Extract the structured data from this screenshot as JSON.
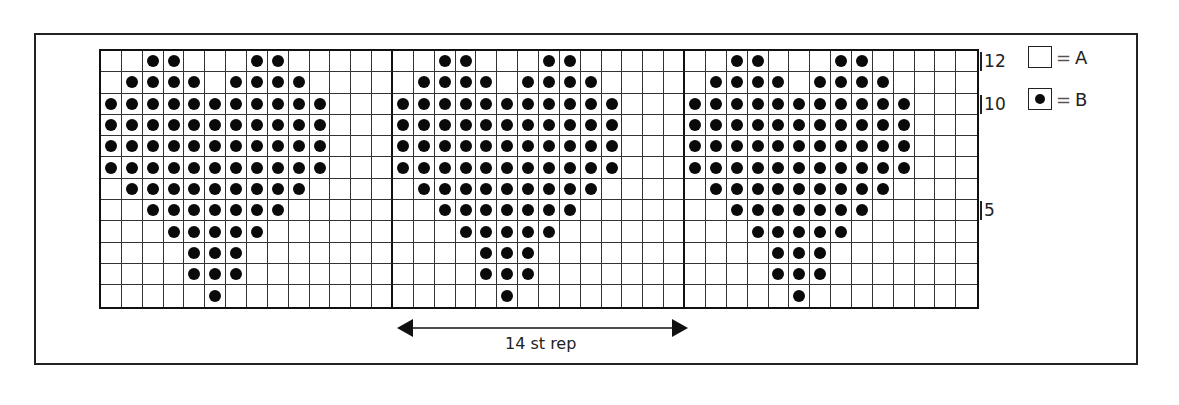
{
  "chart": {
    "stitch_repeat": 14,
    "repeats_shown": 3,
    "rows": 12,
    "repeat_label": "14 st rep",
    "row_labels": [
      {
        "row": 12,
        "text": "12"
      },
      {
        "row": 10,
        "text": "10"
      },
      {
        "row": 5,
        "text": "5"
      }
    ],
    "pattern_rows_top_to_bottom": [
      {
        "row": 12,
        "dots": [
          2,
          3,
          7,
          8
        ]
      },
      {
        "row": 11,
        "dots": [
          1,
          2,
          3,
          4,
          6,
          7,
          8,
          9
        ]
      },
      {
        "row": 10,
        "dots": [
          0,
          1,
          2,
          3,
          4,
          5,
          6,
          7,
          8,
          9,
          10
        ]
      },
      {
        "row": 9,
        "dots": [
          0,
          1,
          2,
          3,
          4,
          5,
          6,
          7,
          8,
          9,
          10
        ]
      },
      {
        "row": 8,
        "dots": [
          0,
          1,
          2,
          3,
          4,
          5,
          6,
          7,
          8,
          9,
          10
        ]
      },
      {
        "row": 7,
        "dots": [
          0,
          1,
          2,
          3,
          4,
          5,
          6,
          7,
          8,
          9,
          10
        ]
      },
      {
        "row": 6,
        "dots": [
          1,
          2,
          3,
          4,
          5,
          6,
          7,
          8,
          9
        ]
      },
      {
        "row": 5,
        "dots": [
          2,
          3,
          4,
          5,
          6,
          7,
          8
        ]
      },
      {
        "row": 4,
        "dots": [
          3,
          4,
          5,
          6,
          7
        ]
      },
      {
        "row": 3,
        "dots": [
          4,
          5,
          6
        ]
      },
      {
        "row": 2,
        "dots": [
          4,
          5,
          6
        ]
      },
      {
        "row": 1,
        "dots": [
          5
        ]
      }
    ]
  },
  "legend": {
    "items": [
      {
        "symbol": "empty-square",
        "equals": "=",
        "label": "A"
      },
      {
        "symbol": "dot-square",
        "equals": "=",
        "label": "B"
      }
    ]
  },
  "colors": {
    "ink": "#0a0a0a",
    "background": "#ffffff"
  }
}
